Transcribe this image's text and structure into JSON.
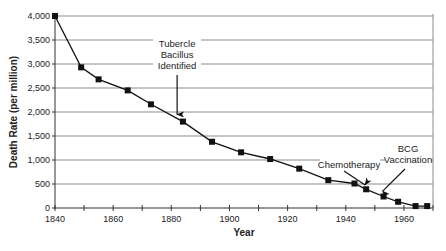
{
  "chart_data": {
    "type": "line",
    "title": "",
    "xlabel": "Year",
    "ylabel": "Death Rate (per million)",
    "xlim": [
      1840,
      1970
    ],
    "ylim": [
      0,
      4000
    ],
    "x_ticks": [
      1840,
      1860,
      1880,
      1900,
      1920,
      1940,
      1960
    ],
    "x_minor_ticks": [
      1850,
      1870,
      1890,
      1910,
      1930,
      1950
    ],
    "y_ticks": [
      0,
      500,
      1000,
      1500,
      2000,
      2500,
      3000,
      3500,
      4000
    ],
    "y_tick_labels": [
      "0",
      "500",
      "1,000",
      "1,500",
      "2,000",
      "2,500",
      "3,000",
      "3,500",
      "4,000"
    ],
    "grid": "horizontal",
    "legend": null,
    "series": [
      {
        "name": "Death Rate",
        "marker": "square",
        "color": "#111111",
        "x": [
          1840,
          1849,
          1855,
          1865,
          1873,
          1884,
          1894,
          1904,
          1914,
          1924,
          1934,
          1943,
          1947,
          1953,
          1958,
          1964,
          1968
        ],
        "values": [
          4000,
          2930,
          2680,
          2450,
          2160,
          1800,
          1380,
          1160,
          1020,
          820,
          580,
          510,
          390,
          240,
          130,
          40,
          40
        ]
      }
    ],
    "annotations": [
      {
        "lines": [
          "Tubercle",
          "Bacillus",
          "Identified"
        ],
        "arrow_to_year": 1882,
        "arrow_to_value": 1950
      },
      {
        "lines": [
          "Chemotherapy"
        ],
        "arrow_to_year": 1947,
        "arrow_to_value": 440
      },
      {
        "lines": [
          "BCG",
          "Vaccination"
        ],
        "arrow_to_year": 1952,
        "arrow_to_value": 330
      }
    ]
  }
}
